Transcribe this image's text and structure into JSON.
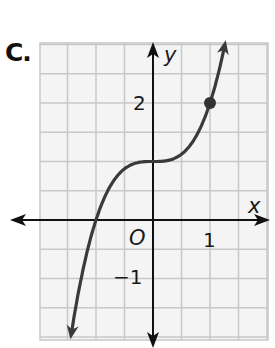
{
  "problem": {
    "label": "C."
  },
  "graph": {
    "x_axis_label": "x",
    "y_axis_label": "y",
    "origin_label": "O",
    "tick_labels": {
      "x_1": "1",
      "y_2": "2",
      "y_neg1": "−1"
    },
    "grid_step": 0.5,
    "x_range": [
      -1.95,
      2.0
    ],
    "y_range": [
      -2.05,
      3.0
    ],
    "point": {
      "x": 1,
      "y": 2
    },
    "function": "y = x^3 + 1",
    "colors": {
      "grid": "#c8c8c8",
      "grid_bg": "#f4f4f4",
      "axis": "#111111",
      "curve": "#3a3a3a"
    }
  },
  "chart_data": {
    "type": "line",
    "title": "",
    "xlabel": "x",
    "ylabel": "y",
    "series": [
      {
        "name": "y = x^3 + 1",
        "x": [
          -1.45,
          -1.25,
          -1.0,
          -0.75,
          -0.5,
          -0.25,
          0,
          0.25,
          0.5,
          0.75,
          1.0,
          1.26
        ],
        "y": [
          -2.05,
          -0.95,
          0.0,
          0.58,
          0.875,
          0.98,
          1.0,
          1.02,
          1.125,
          1.42,
          2.0,
          3.0
        ]
      }
    ],
    "points": [
      {
        "x": 1,
        "y": 2
      }
    ],
    "ticks": {
      "x": [
        "1"
      ],
      "y": [
        "2",
        "−1"
      ]
    },
    "grid": true,
    "xlim": [
      -1.95,
      2.0
    ],
    "ylim": [
      -2.05,
      3.0
    ]
  }
}
